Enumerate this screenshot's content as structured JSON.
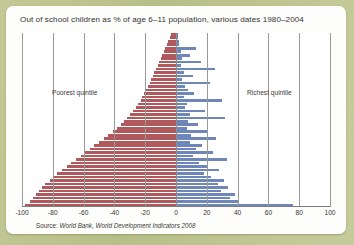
{
  "figure": {
    "title": "Out of school children as % of age 6–11 population, various dates 1980–2004",
    "source_lead": "Source: ",
    "source_text": "World Bank, World Development Indicators 2008",
    "annotation_left": "Poorest quintile",
    "annotation_right": "Richest quintile"
  },
  "colors": {
    "page_background": "#bcc28f",
    "card_background": "#fdfdfb",
    "plot_background": "#ffffff",
    "poorest_bar": "#b0595d",
    "richest_bar": "#6e86b9",
    "gridline": "#9a9a96",
    "axis": "#7d7d79",
    "text": "#34332f"
  },
  "chart_data": {
    "type": "bar",
    "orientation": "horizontal",
    "subtype": "butterfly-diverging",
    "title": "Out of school children as % of age 6–11 population, various dates 1980–2004",
    "xlabel": "",
    "ylabel": "",
    "xlim": [
      -100,
      100
    ],
    "xticks": [
      -100,
      -80,
      -60,
      -40,
      -20,
      0,
      20,
      40,
      60,
      80,
      100
    ],
    "xticklabels": [
      "-100",
      "-80",
      "-60",
      "-40",
      "-20",
      "0",
      "20",
      "40",
      "60",
      "80",
      "100"
    ],
    "grid": true,
    "grid_axis": "x",
    "legend": false,
    "note": "Left (red) series plotted as negative values; magnitude is the percent of children out of school in the poorest quintile. Right (blue) series is the richest quintile. Rows are countries sorted by poorest-quintile magnitude ascending from top to bottom.",
    "annotations": [
      {
        "text": "Poorest quintile",
        "x": -70,
        "row": 14
      },
      {
        "text": "Richest quintile",
        "x": 60,
        "row": 14
      }
    ],
    "series": [
      {
        "name": "Poorest quintile",
        "color": "#b0595d",
        "sign": "negative",
        "values": [
          -3,
          -4,
          -5,
          -6,
          -7,
          -8,
          -9,
          -10,
          -11,
          -12,
          -13,
          -14,
          -15,
          -16,
          -17,
          -18,
          -20,
          -21,
          -22,
          -23,
          -25,
          -26,
          -28,
          -30,
          -32,
          -34,
          -36,
          -38,
          -41,
          -44,
          -47,
          -50,
          -53,
          -56,
          -59,
          -62,
          -65,
          -68,
          -71,
          -74,
          -77,
          -80,
          -82,
          -85,
          -87,
          -89,
          -91,
          -93,
          -95,
          -98
        ]
      },
      {
        "name": "Richest quintile",
        "color": "#6e86b9",
        "sign": "positive",
        "values": [
          1,
          1,
          2,
          2,
          13,
          3,
          9,
          4,
          16,
          3,
          25,
          5,
          11,
          4,
          22,
          6,
          8,
          12,
          5,
          30,
          7,
          6,
          19,
          9,
          32,
          8,
          14,
          7,
          21,
          10,
          26,
          9,
          17,
          13,
          24,
          11,
          33,
          15,
          20,
          28,
          18,
          23,
          31,
          27,
          34,
          29,
          38,
          35,
          41,
          76
        ]
      }
    ],
    "categories": [
      "row-01",
      "row-02",
      "row-03",
      "row-04",
      "row-05",
      "row-06",
      "row-07",
      "row-08",
      "row-09",
      "row-10",
      "row-11",
      "row-12",
      "row-13",
      "row-14",
      "row-15",
      "row-16",
      "row-17",
      "row-18",
      "row-19",
      "row-20",
      "row-21",
      "row-22",
      "row-23",
      "row-24",
      "row-25",
      "row-26",
      "row-27",
      "row-28",
      "row-29",
      "row-30",
      "row-31",
      "row-32",
      "row-33",
      "row-34",
      "row-35",
      "row-36",
      "row-37",
      "row-38",
      "row-39",
      "row-40",
      "row-41",
      "row-42",
      "row-43",
      "row-44",
      "row-45",
      "row-46",
      "row-47",
      "row-48",
      "row-49",
      "row-50"
    ]
  }
}
